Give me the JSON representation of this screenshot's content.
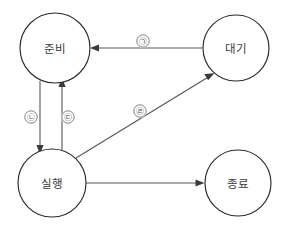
{
  "diagram": {
    "type": "state-transition-diagram",
    "background_color": "#ffffff",
    "node_stroke_color": "#2b2b2b",
    "edge_color": "#55555c",
    "label_color": "#3a3a3a",
    "states": [
      {
        "id": "ready",
        "label": "준비",
        "cx": 55,
        "cy": 48,
        "r": 35
      },
      {
        "id": "waiting",
        "label": "대기",
        "cx": 236,
        "cy": 48,
        "r": 33
      },
      {
        "id": "running",
        "label": "실행",
        "cx": 52,
        "cy": 183,
        "r": 34
      },
      {
        "id": "terminated",
        "label": "종료",
        "cx": 238,
        "cy": 183,
        "r": 33
      }
    ],
    "transitions": [
      {
        "id": "t1",
        "marker": "㉠",
        "from": "waiting",
        "to": "ready",
        "marker_x": 143,
        "marker_y": 41
      },
      {
        "id": "t2",
        "marker": "㉡",
        "from": "ready",
        "to": "running",
        "marker_x": 31,
        "marker_y": 117
      },
      {
        "id": "t3",
        "marker": "㉢",
        "from": "running",
        "to": "ready",
        "marker_x": 68,
        "marker_y": 117
      },
      {
        "id": "t4",
        "marker": "㉣",
        "from": "running",
        "to": "waiting",
        "marker_x": 140,
        "marker_y": 111
      },
      {
        "id": "t5",
        "marker": "",
        "from": "running",
        "to": "terminated",
        "marker_x": null,
        "marker_y": null
      }
    ]
  }
}
